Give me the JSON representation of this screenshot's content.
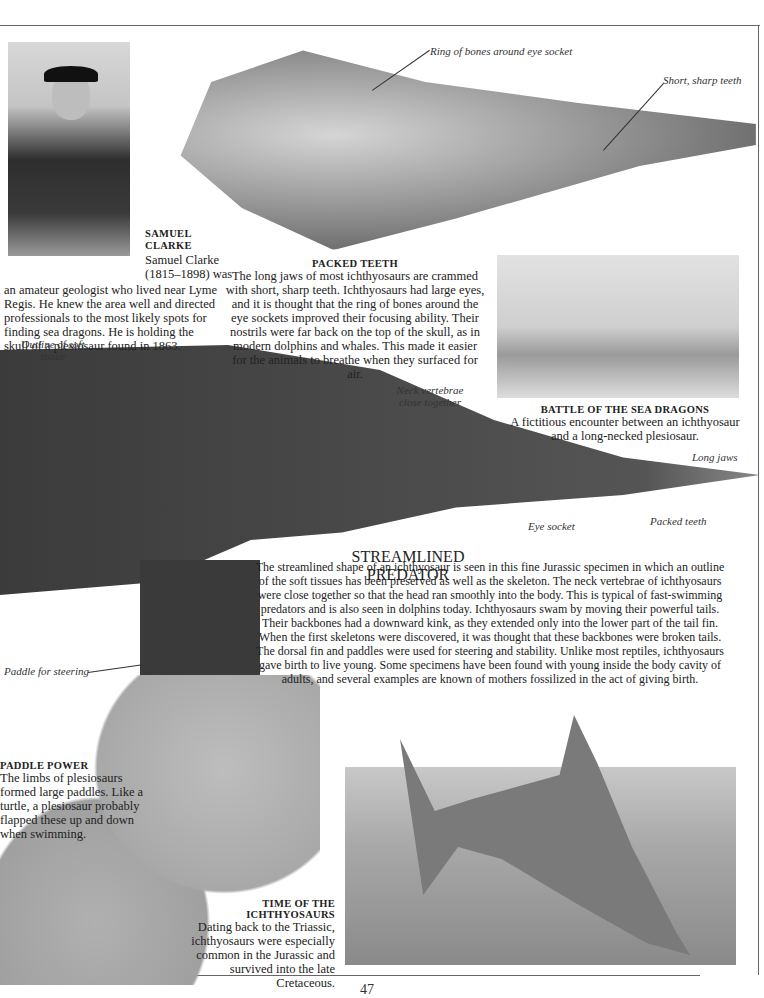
{
  "page": {
    "number": "47"
  },
  "clarke": {
    "heading_line1": "SAMUEL",
    "heading_line2": "CLARKE",
    "intro_line1": "Samuel Clarke",
    "intro_line2": "(1815–1898) was",
    "body": "an amateur geologist who lived near Lyme Regis. He knew the area well and directed professionals to the most likely spots for finding sea dragons. He is holding the skull of a plesiosaur found in 1863."
  },
  "skull": {
    "label_ring": "Ring of bones around eye socket",
    "label_teeth": "Short, sharp teeth"
  },
  "packed_teeth": {
    "heading": "PACKED TEETH",
    "body": "The long jaws of most ichthyosaurs are crammed with short, sharp teeth. Ichthyosaurs had large eyes, and it is thought that the ring of bones around the eye sockets improved their focusing ability. Their nostrils were far back on the top of the skull, as in modern dolphins and whales. This made it easier for the animals to breathe when they surfaced for air."
  },
  "battle": {
    "heading": "BATTLE OF THE SEA DRAGONS",
    "body": "A fictitious encounter between an ichthyosaur and a long-necked plesiosaur."
  },
  "fossil": {
    "label_outline": "Outline of soft tissue",
    "label_neck": "Neck vertebrae close together",
    "label_jaws": "Long jaws",
    "label_eye": "Eye socket",
    "label_packed": "Packed teeth",
    "label_paddle": "Paddle for steering"
  },
  "predator": {
    "heading": "STREAMLINED PREDATOR",
    "body": "The streamlined shape of an ichthyosaur is seen in this fine Jurassic specimen in which an outline of the soft tissues has been preserved as well as the skeleton. The neck vertebrae of ichthyosaurs were close together so that the head ran smoothly into the body. This is typical of fast-swimming predators and is also seen in dolphins today. Ichthyosaurs swam by moving their powerful tails. Their backbones had a downward kink, as they extended only into the lower part of the tail fin. When the first skeletons were discovered, it was thought that these backbones were broken tails. The dorsal fin and paddles were used for steering and stability. Unlike most reptiles, ichthyosaurs gave birth to live young. Some specimens have been found with young inside the body cavity of adults, and several examples are known of mothers fossilized in the act of giving birth."
  },
  "paddle_power": {
    "heading": "PADDLE POWER",
    "body": "The limbs of plesiosaurs formed large paddles. Like a turtle, a plesiosaur probably flapped these up and down when swimming."
  },
  "time": {
    "heading_line1": "TIME OF THE",
    "heading_line2": "ICHTHYOSAURS",
    "body": "Dating back to the Triassic, ichthyosaurs were especially common in the Jurassic and survived into the late Cretaceous."
  }
}
